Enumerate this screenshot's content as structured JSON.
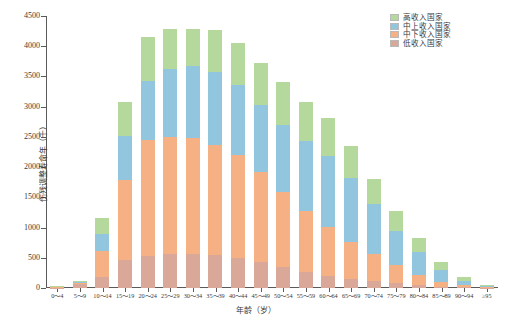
{
  "chart_data": {
    "type": "bar",
    "stacked": true,
    "title": "",
    "xlabel": "年龄（岁）",
    "ylabel": "伤残调整寿命年（千）",
    "grid": false,
    "legend_position": "top-right",
    "ylim": [
      0,
      4500
    ],
    "yticks": [
      0,
      500,
      1000,
      1500,
      2000,
      2500,
      3000,
      3500,
      4000,
      4500
    ],
    "ytick_labels": [
      "0",
      "500",
      "1000",
      "1500",
      "2000",
      "2500",
      "3000",
      "3500",
      "4000",
      "4500"
    ],
    "categories": [
      "0～4",
      "5～9",
      "10～14",
      "15～19",
      "20～24",
      "25～29",
      "30～34",
      "35～39",
      "40～44",
      "45～49",
      "50～54",
      "55～59",
      "60～64",
      "65～69",
      "70～74",
      "75～79",
      "80～84",
      "85～89",
      "90～94",
      "≥95"
    ],
    "series": [
      {
        "name": "低收入国家",
        "color": "#d9a898",
        "values": [
          8,
          60,
          185,
          460,
          530,
          560,
          560,
          540,
          500,
          430,
          340,
          260,
          200,
          150,
          110,
          75,
          45,
          22,
          9,
          3
        ]
      },
      {
        "name": "中下收入国家",
        "color": "#f5b183",
        "values": [
          10,
          25,
          420,
          1320,
          1925,
          1940,
          1930,
          1820,
          1700,
          1490,
          1250,
          1020,
          810,
          610,
          450,
          300,
          175,
          85,
          33,
          10
        ]
      },
      {
        "name": "中上收入国家",
        "color": "#92c5de",
        "values": [
          7,
          15,
          290,
          730,
          965,
          1120,
          1180,
          1215,
          1155,
          1105,
          1105,
          1145,
          1175,
          1060,
          830,
          575,
          370,
          190,
          78,
          22
        ]
      },
      {
        "name": "高收入国家",
        "color": "#b5d99c",
        "values": [
          5,
          10,
          270,
          565,
          740,
          660,
          620,
          690,
          705,
          700,
          715,
          655,
          620,
          525,
          420,
          320,
          235,
          140,
          62,
          20
        ]
      }
    ],
    "totals": [
      30,
      110,
      1165,
      3075,
      4160,
      4280,
      4290,
      4265,
      4060,
      3725,
      3410,
      3080,
      2805,
      2345,
      1810,
      1270,
      825,
      437,
      182,
      55
    ]
  }
}
